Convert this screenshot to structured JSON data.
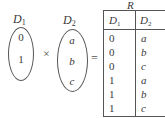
{
  "sets": [
    {
      "name": "D",
      "sub": "1",
      "elements": [
        "0",
        "1"
      ]
    },
    {
      "name": "D",
      "sub": "2",
      "elements": [
        "a",
        "b",
        "c"
      ]
    }
  ],
  "operators": {
    "product": "×",
    "equals": "="
  },
  "relation": {
    "name": "R",
    "columns": [
      {
        "name": "D",
        "sub": "1"
      },
      {
        "name": "D",
        "sub": "2"
      }
    ],
    "rows": [
      [
        "0",
        "a"
      ],
      [
        "0",
        "b"
      ],
      [
        "0",
        "c"
      ],
      [
        "1",
        "a"
      ],
      [
        "1",
        "b"
      ],
      [
        "1",
        "c"
      ]
    ]
  }
}
